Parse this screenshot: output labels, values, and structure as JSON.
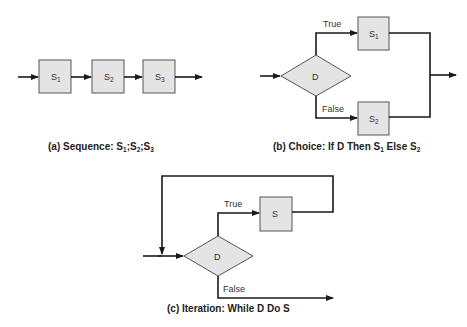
{
  "diagrams": {
    "sequence": {
      "caption_prefix": "(a) Sequence: ",
      "caption_parts": [
        "S",
        "1",
        ";S",
        "2",
        ";S",
        "3"
      ],
      "nodes": [
        {
          "label": "S",
          "sub": "1"
        },
        {
          "label": "S",
          "sub": "2"
        },
        {
          "label": "S",
          "sub": "3"
        }
      ]
    },
    "choice": {
      "caption_prefix": "(b) Choice: If D Then S",
      "caption_sub1": "1",
      "caption_mid": " Else S",
      "caption_sub2": "2",
      "decision": "D",
      "true_label": "True",
      "false_label": "False",
      "nodes": [
        {
          "label": "S",
          "sub": "1"
        },
        {
          "label": "S",
          "sub": "2"
        }
      ]
    },
    "iteration": {
      "caption": "(c) Iteration: While D Do S",
      "decision": "D",
      "true_label": "True",
      "false_label": "False",
      "body": "S"
    }
  },
  "colors": {
    "box_fill": "#e4e4e4",
    "line": "#1a1a1a"
  }
}
